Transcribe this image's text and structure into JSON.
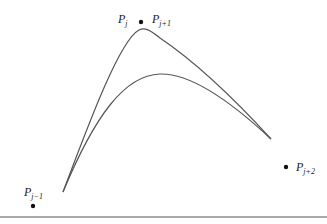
{
  "diagram": {
    "type": "spline-control-points",
    "points": [
      {
        "id": "pj-minus-1",
        "label": "P",
        "subscript": "j−1",
        "x": 33,
        "y": 206,
        "label_x": 24,
        "label_y": 196
      },
      {
        "id": "pj",
        "label": "P",
        "subscript": "j",
        "x": 141,
        "y": 22,
        "label_x": 118,
        "label_y": 23
      },
      {
        "id": "pj-plus-1",
        "label": "P",
        "subscript": "j+1",
        "x": 141,
        "y": 22,
        "label_x": 152,
        "label_y": 23
      },
      {
        "id": "pj-plus-2",
        "label": "P",
        "subscript": "j+2",
        "x": 286,
        "y": 167,
        "label_x": 296,
        "label_y": 171
      }
    ],
    "curves": [
      {
        "id": "upper-curve",
        "description": "curve through doubled control point (sharp peak)",
        "path": "M63,192 C90,120 120,40 139,30 C145,27 150,30 160,38 C200,65 240,105 271,139"
      },
      {
        "id": "lower-curve",
        "description": "smoother curve (rounded peak)",
        "path": "M63,192 C95,115 125,75 160,74 C195,73 240,110 271,139"
      }
    ],
    "baseline": {
      "y": 217,
      "x1": 0,
      "x2": 327
    },
    "colors": {
      "curve": "#555555",
      "point": "#111111",
      "baseline": "#555555",
      "text": "#222222"
    }
  }
}
